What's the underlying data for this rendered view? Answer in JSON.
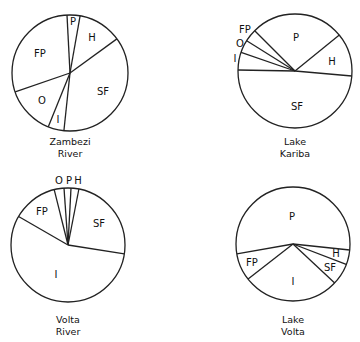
{
  "chart_data": [
    {
      "type": "pie",
      "title": "Zambezi River",
      "title_lines": [
        "Zambezi",
        "River"
      ],
      "center": [
        70,
        73
      ],
      "radius": 58,
      "slices": [
        {
          "label": "P",
          "start_deg": 357,
          "end_deg": 10,
          "percent": 3.6,
          "label_pos": [
            73,
            22
          ]
        },
        {
          "label": "H",
          "start_deg": 10,
          "end_deg": 54,
          "percent": 12.2,
          "label_pos": [
            92,
            38
          ]
        },
        {
          "label": "SF",
          "start_deg": 54,
          "end_deg": 186,
          "percent": 36.7,
          "label_pos": [
            103,
            92
          ]
        },
        {
          "label": "I",
          "start_deg": 186,
          "end_deg": 202,
          "percent": 4.4,
          "label_pos": [
            58,
            120
          ]
        },
        {
          "label": "O",
          "start_deg": 202,
          "end_deg": 251,
          "percent": 13.6,
          "label_pos": [
            42,
            101
          ]
        },
        {
          "label": "FP",
          "start_deg": 251,
          "end_deg": 357,
          "percent": 29.4,
          "label_pos": [
            40,
            54
          ]
        }
      ]
    },
    {
      "type": "pie",
      "title": "Lake Kariba",
      "title_lines": [
        "Lake",
        "Kariba"
      ],
      "center": [
        295,
        71
      ],
      "radius": 57,
      "slices": [
        {
          "label": "P",
          "start_deg": 315,
          "end_deg": 51,
          "percent": 26.7,
          "label_pos": [
            296,
            38
          ]
        },
        {
          "label": "H",
          "start_deg": 51,
          "end_deg": 95,
          "percent": 12.2,
          "label_pos": [
            332,
            62
          ]
        },
        {
          "label": "SF",
          "start_deg": 95,
          "end_deg": 271,
          "percent": 48.9,
          "label_pos": [
            297,
            107
          ]
        },
        {
          "label": "I",
          "start_deg": 271,
          "end_deg": 289,
          "percent": 5.0,
          "label_pos": [
            235,
            59
          ]
        },
        {
          "label": "O",
          "start_deg": 289,
          "end_deg": 302,
          "percent": 3.6,
          "label_pos": [
            240,
            44
          ]
        },
        {
          "label": "FP",
          "start_deg": 302,
          "end_deg": 315,
          "percent": 3.6,
          "label_pos": [
            245,
            30
          ]
        }
      ]
    },
    {
      "type": "pie",
      "title": "Volta River",
      "title_lines": [
        "Volta",
        "River"
      ],
      "center": [
        68,
        245
      ],
      "radius": 57,
      "slices": [
        {
          "label": "O",
          "start_deg": 346,
          "end_deg": 356,
          "percent": 2.8,
          "label_pos": [
            59,
            181
          ]
        },
        {
          "label": "P",
          "start_deg": 356,
          "end_deg": 3,
          "percent": 1.9,
          "label_pos": [
            69,
            181
          ]
        },
        {
          "label": "H",
          "start_deg": 3,
          "end_deg": 11,
          "percent": 2.2,
          "label_pos": [
            78,
            181
          ]
        },
        {
          "label": "SF",
          "start_deg": 11,
          "end_deg": 99,
          "percent": 24.4,
          "label_pos": [
            99,
            224
          ]
        },
        {
          "label": "I",
          "start_deg": 99,
          "end_deg": 300,
          "percent": 55.8,
          "label_pos": [
            56,
            275
          ]
        },
        {
          "label": "FP",
          "start_deg": 300,
          "end_deg": 346,
          "percent": 12.8,
          "label_pos": [
            42,
            212
          ]
        }
      ]
    },
    {
      "type": "pie",
      "title": "Lake Volta",
      "title_lines": [
        "Lake",
        "Volta"
      ],
      "center": [
        293,
        244
      ],
      "radius": 57,
      "slices": [
        {
          "label": "P",
          "start_deg": 260,
          "end_deg": 96,
          "percent": 54.4,
          "label_pos": [
            292,
            217
          ]
        },
        {
          "label": "H",
          "start_deg": 96,
          "end_deg": 111,
          "percent": 4.2,
          "label_pos": [
            336,
            254
          ]
        },
        {
          "label": "SF",
          "start_deg": 111,
          "end_deg": 133,
          "percent": 6.1,
          "label_pos": [
            330,
            268
          ]
        },
        {
          "label": "I",
          "start_deg": 133,
          "end_deg": 232,
          "percent": 27.5,
          "label_pos": [
            293,
            282
          ]
        },
        {
          "label": "FP",
          "start_deg": 232,
          "end_deg": 260,
          "percent": 7.8,
          "label_pos": [
            252,
            263
          ]
        }
      ]
    }
  ],
  "captions": {
    "zambezi": {
      "line1": "Zambezi",
      "line2": "River"
    },
    "kariba": {
      "line1": "Lake",
      "line2": "Kariba"
    },
    "volta_river": {
      "line1": "Volta",
      "line2": "River"
    },
    "lake_volta": {
      "line1": "Lake",
      "line2": "Volta"
    }
  },
  "legend_abbreviations": [
    "P",
    "H",
    "SF",
    "I",
    "O",
    "FP"
  ]
}
